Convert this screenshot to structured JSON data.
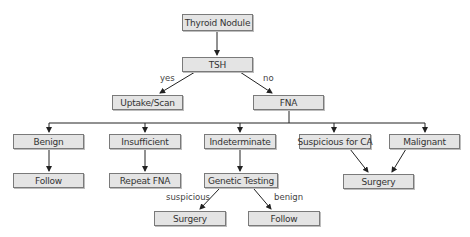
{
  "diagram": {
    "type": "flowchart",
    "nodes": {
      "thyroid_nodule": "Thyroid Nodule",
      "tsh": "TSH",
      "uptake_scan": "Uptake/Scan",
      "fna": "FNA",
      "benign": "Benign",
      "insufficient": "Insufficient",
      "indeterminate": "Indeterminate",
      "suspicious_ca": "Suspicious for CA",
      "malignant": "Malignant",
      "follow_1": "Follow",
      "repeat_fna": "Repeat FNA",
      "genetic_testing": "Genetic Testing",
      "surgery_1": "Surgery",
      "surgery_2": "Surgery",
      "follow_2": "Follow"
    },
    "edge_labels": {
      "tsh_yes": "yes",
      "tsh_no": "no",
      "genetic_suspicious": "suspicious",
      "genetic_benign": "benign"
    },
    "edges": [
      {
        "from": "Thyroid Nodule",
        "to": "TSH"
      },
      {
        "from": "TSH",
        "to": "Uptake/Scan",
        "label": "yes"
      },
      {
        "from": "TSH",
        "to": "FNA",
        "label": "no"
      },
      {
        "from": "FNA",
        "to": "Benign"
      },
      {
        "from": "FNA",
        "to": "Insufficient"
      },
      {
        "from": "FNA",
        "to": "Indeterminate"
      },
      {
        "from": "FNA",
        "to": "Suspicious for CA"
      },
      {
        "from": "FNA",
        "to": "Malignant"
      },
      {
        "from": "Benign",
        "to": "Follow"
      },
      {
        "from": "Insufficient",
        "to": "Repeat FNA"
      },
      {
        "from": "Indeterminate",
        "to": "Genetic Testing"
      },
      {
        "from": "Suspicious for CA",
        "to": "Surgery"
      },
      {
        "from": "Malignant",
        "to": "Surgery"
      },
      {
        "from": "Genetic Testing",
        "to": "Surgery",
        "label": "suspicious"
      },
      {
        "from": "Genetic Testing",
        "to": "Follow",
        "label": "benign"
      }
    ]
  }
}
